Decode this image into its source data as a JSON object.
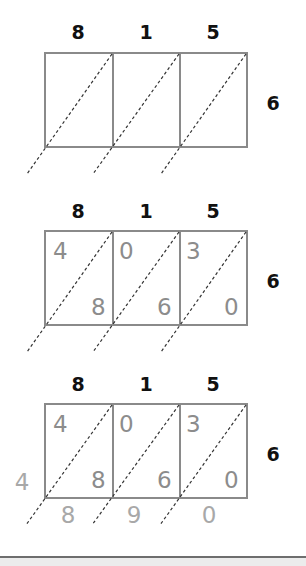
{
  "diagram": {
    "colors": {
      "grid": "#8a8a8a",
      "label": "#111111",
      "digit": "#8c8c8c",
      "sum": "#a8a8a8"
    },
    "multiplicand_digits": [
      "8",
      "1",
      "5"
    ],
    "multiplier_digit": "6",
    "steps": [
      {
        "name": "empty-lattice",
        "top_labels": [
          "8",
          "1",
          "5"
        ],
        "right_label": "6",
        "cells": []
      },
      {
        "name": "filled-products",
        "top_labels": [
          "8",
          "1",
          "5"
        ],
        "right_label": "6",
        "cells": [
          {
            "tens": "4",
            "ones": "8"
          },
          {
            "tens": "0",
            "ones": "6"
          },
          {
            "tens": "3",
            "ones": "0"
          }
        ]
      },
      {
        "name": "diagonal-sums",
        "top_labels": [
          "8",
          "1",
          "5"
        ],
        "right_label": "6",
        "cells": [
          {
            "tens": "4",
            "ones": "8"
          },
          {
            "tens": "0",
            "ones": "6"
          },
          {
            "tens": "3",
            "ones": "0"
          }
        ],
        "left_sum": "4",
        "bottom_sums": [
          "8",
          "9",
          "0"
        ]
      }
    ]
  }
}
